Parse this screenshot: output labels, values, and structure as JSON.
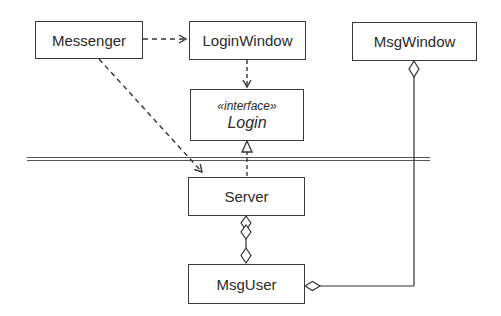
{
  "diagram": {
    "type": "UML class diagram",
    "classes": [
      {
        "id": "messenger",
        "name": "Messenger"
      },
      {
        "id": "loginwindow",
        "name": "LoginWindow"
      },
      {
        "id": "msgwindow",
        "name": "MsgWindow"
      },
      {
        "id": "login",
        "name": "Login",
        "stereotype": "«interface»"
      },
      {
        "id": "server",
        "name": "Server"
      },
      {
        "id": "msguser",
        "name": "MsgUser"
      }
    ],
    "relationships": [
      {
        "from": "Messenger",
        "to": "LoginWindow",
        "kind": "dependency"
      },
      {
        "from": "Messenger",
        "to": "Server",
        "kind": "dependency"
      },
      {
        "from": "LoginWindow",
        "to": "Login",
        "kind": "dependency"
      },
      {
        "from": "Server",
        "to": "Login",
        "kind": "realization"
      },
      {
        "from": "Server",
        "to": "MsgUser",
        "kind": "aggregation"
      },
      {
        "from": "MsgUser",
        "to": "Server",
        "kind": "aggregation"
      },
      {
        "from": "MsgWindow",
        "to": "MsgUser",
        "kind": "aggregation"
      },
      {
        "from": "MsgUser",
        "to": "MsgWindow",
        "kind": "aggregation"
      }
    ],
    "separator": "boundary double line"
  }
}
